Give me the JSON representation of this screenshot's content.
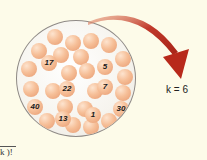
{
  "diagram": {
    "type": "urn-sampling",
    "urn": {
      "labeled_balls": [
        "17",
        "5",
        "22",
        "7",
        "40",
        "30",
        "13",
        "1"
      ]
    },
    "arrow": {
      "color": "#c0392b"
    },
    "k_label": "k = 6",
    "formula_fragment": "k )!"
  },
  "colors": {
    "background": "#fdfbe9",
    "ball": "#f6bf98",
    "arrow": "#c0392b"
  }
}
